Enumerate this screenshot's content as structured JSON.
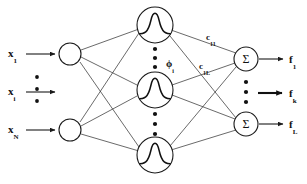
{
  "figure": {
    "kind": "rbf-neural-network-diagram",
    "background_color": "#ffffff",
    "stroke_color": "#1a1a1a",
    "width": 307,
    "height": 184
  },
  "layers": {
    "input": {
      "name": "input-layer",
      "node_shape": "empty-circle",
      "nodes": [
        {
          "id": "in-1",
          "cx": 70,
          "cy": 54,
          "r": 11
        },
        {
          "id": "in-N",
          "cx": 70,
          "cy": 130,
          "r": 11
        }
      ],
      "labels": [
        {
          "id": "x1",
          "base": "x",
          "sub": "1",
          "x": 8,
          "y": 44
        },
        {
          "id": "xi",
          "base": "x",
          "sub": "i",
          "x": 8,
          "y": 84
        },
        {
          "id": "xN",
          "base": "x",
          "sub": "N",
          "x": 8,
          "y": 121
        }
      ],
      "ellipsis_dots": [
        {
          "cx": 37,
          "cy": 77
        },
        {
          "cx": 37,
          "cy": 89
        },
        {
          "cx": 37,
          "cy": 101
        }
      ],
      "arrows": [
        {
          "id": "in-arrow-1",
          "x1": 26,
          "y1": 54,
          "x2": 57,
          "y2": 54
        },
        {
          "id": "in-arrow-i",
          "x1": 26,
          "y1": 92,
          "x2": 57,
          "y2": 92
        },
        {
          "id": "in-arrow-N",
          "x1": 26,
          "y1": 130,
          "x2": 57,
          "y2": 130
        }
      ]
    },
    "hidden": {
      "name": "hidden-layer",
      "node_shape": "gaussian-bell-curve",
      "nodes": [
        {
          "id": "hid-1",
          "cx": 155,
          "cy": 25,
          "r": 18
        },
        {
          "id": "hid-mid",
          "cx": 155,
          "cy": 90,
          "r": 18
        },
        {
          "id": "hid-M",
          "cx": 155,
          "cy": 155,
          "r": 18
        }
      ],
      "ellipsis_dots": [
        {
          "cx": 155,
          "cy": 49
        },
        {
          "cx": 155,
          "cy": 58
        },
        {
          "cx": 155,
          "cy": 67
        },
        {
          "cx": 155,
          "cy": 114
        },
        {
          "cx": 155,
          "cy": 124
        },
        {
          "cx": 155,
          "cy": 134
        }
      ],
      "labels": [
        {
          "id": "phi-i",
          "base": "ϕ",
          "sub": "i",
          "x": 165,
          "y": 56
        }
      ]
    },
    "output": {
      "name": "output-layer",
      "node_shape": "sigma-circle",
      "node_glyph": "Σ",
      "nodes": [
        {
          "id": "out-1",
          "cx": 246,
          "cy": 59,
          "r": 12
        },
        {
          "id": "out-L",
          "cx": 246,
          "cy": 124,
          "r": 12
        }
      ],
      "ellipsis_dots": [
        {
          "cx": 246,
          "cy": 82
        },
        {
          "cx": 246,
          "cy": 92
        },
        {
          "cx": 246,
          "cy": 102
        }
      ],
      "labels": [
        {
          "id": "f1",
          "base": "f",
          "sub": "1",
          "x": 288,
          "y": 50
        },
        {
          "id": "fk",
          "base": "f",
          "sub": "k",
          "x": 288,
          "y": 85
        },
        {
          "id": "fL",
          "base": "f",
          "sub": "L",
          "x": 288,
          "y": 116
        }
      ],
      "arrows": [
        {
          "id": "out-arrow-1",
          "x1": 259,
          "y1": 59,
          "x2": 285,
          "y2": 59,
          "bold": false
        },
        {
          "id": "out-arrow-k",
          "x1": 259,
          "y1": 93,
          "x2": 285,
          "y2": 93,
          "bold": true
        },
        {
          "id": "out-arrow-L",
          "x1": 259,
          "y1": 124,
          "x2": 285,
          "y2": 124,
          "bold": false
        }
      ]
    }
  },
  "weights": [
    {
      "id": "c11",
      "base": "c",
      "sub": "11",
      "x": 206,
      "y": 28
    },
    {
      "id": "c1L",
      "base": "c",
      "sub": "1L",
      "x": 199,
      "y": 57
    }
  ],
  "edges": {
    "input_to_hidden": [
      {
        "from": "in-1",
        "to": "hid-1",
        "x1": 81,
        "y1": 50,
        "x2": 139,
        "y2": 29
      },
      {
        "from": "in-1",
        "to": "hid-mid",
        "x1": 81,
        "y1": 57,
        "x2": 137,
        "y2": 85
      },
      {
        "from": "in-1",
        "to": "hid-M",
        "x1": 80,
        "y1": 62,
        "x2": 139,
        "y2": 147
      },
      {
        "from": "in-N",
        "to": "hid-1",
        "x1": 80,
        "y1": 122,
        "x2": 139,
        "y2": 33
      },
      {
        "from": "in-N",
        "to": "hid-mid",
        "x1": 81,
        "y1": 126,
        "x2": 137,
        "y2": 96
      },
      {
        "from": "in-N",
        "to": "hid-M",
        "x1": 81,
        "y1": 134,
        "x2": 139,
        "y2": 151
      }
    ],
    "hidden_to_output": [
      {
        "from": "hid-1",
        "to": "out-1",
        "x1": 171,
        "y1": 30,
        "x2": 236,
        "y2": 53
      },
      {
        "from": "hid-1",
        "to": "out-L",
        "x1": 170,
        "y1": 36,
        "x2": 236,
        "y2": 118
      },
      {
        "from": "hid-mid",
        "to": "out-1",
        "x1": 172,
        "y1": 85,
        "x2": 235,
        "y2": 63
      },
      {
        "from": "hid-mid",
        "to": "out-L",
        "x1": 172,
        "y1": 95,
        "x2": 235,
        "y2": 119
      },
      {
        "from": "hid-M",
        "to": "out-1",
        "x1": 170,
        "y1": 146,
        "x2": 236,
        "y2": 67
      },
      {
        "from": "hid-M",
        "to": "out-L",
        "x1": 171,
        "y1": 150,
        "x2": 236,
        "y2": 130
      }
    ]
  }
}
